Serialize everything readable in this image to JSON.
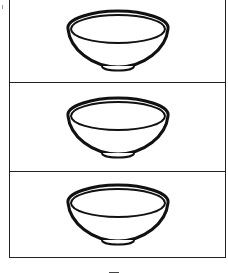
{
  "page": {
    "type": "coloring-worksheet",
    "panels": [
      {
        "icon": "bowl-icon",
        "label": ""
      },
      {
        "icon": "bowl-icon",
        "label": ""
      },
      {
        "icon": "bowl-icon",
        "label": ""
      }
    ]
  },
  "colors": {
    "line": "#111111",
    "background": "#ffffff"
  }
}
